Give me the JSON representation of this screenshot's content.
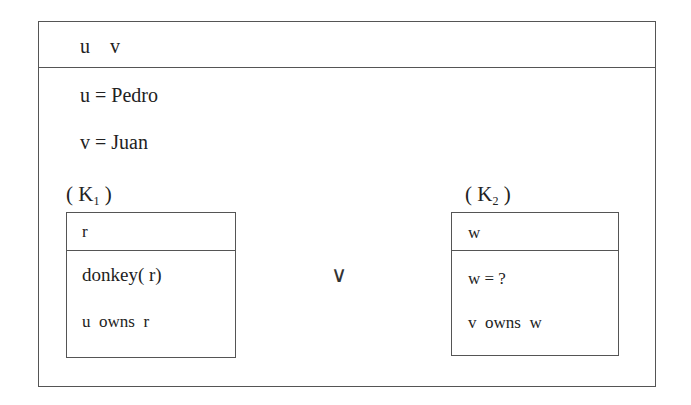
{
  "drs": {
    "universe": "u    v",
    "conditions": [
      "u = Pedro",
      "v = Juan"
    ],
    "disjunction_symbol": "∨",
    "sub_drs": [
      {
        "label_open": "( K",
        "label_index": "1",
        "label_close": " )",
        "universe": "r",
        "conditions": [
          "donkey( r)",
          "u  owns  r"
        ]
      },
      {
        "label_open": "( K",
        "label_index": "2",
        "label_close": " )",
        "universe": "w",
        "conditions": [
          "w = ?",
          "v  owns  w"
        ]
      }
    ]
  }
}
